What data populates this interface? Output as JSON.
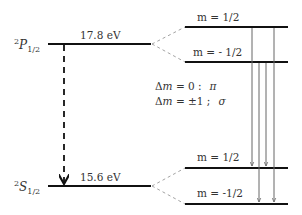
{
  "levels": {
    "upper": {
      "term_sup": "2",
      "term_letter": "P",
      "term_sub": "1/2",
      "energy": "17.8 eV",
      "sublevels": [
        "m = 1/2",
        "m = - 1/2"
      ]
    },
    "lower": {
      "term_sup": "2",
      "term_letter": "S",
      "term_sub": "1/2",
      "energy": "15.6 eV",
      "sublevels": [
        "m = 1/2",
        "m = -1/2"
      ]
    }
  },
  "rules": {
    "pi_rule_left": "Δ",
    "pi_rule_var": "m",
    "pi_rule_eq": " = 0 :",
    "pi_symbol": "π",
    "sigma_rule_left": "Δ",
    "sigma_rule_var": "m",
    "sigma_rule_eq": " = ±1 ;",
    "sigma_symbol": "σ"
  },
  "colors": {
    "level_line": "#111111",
    "dashed_connector": "#999999",
    "transition_line": "#666666",
    "text": "#333333"
  }
}
